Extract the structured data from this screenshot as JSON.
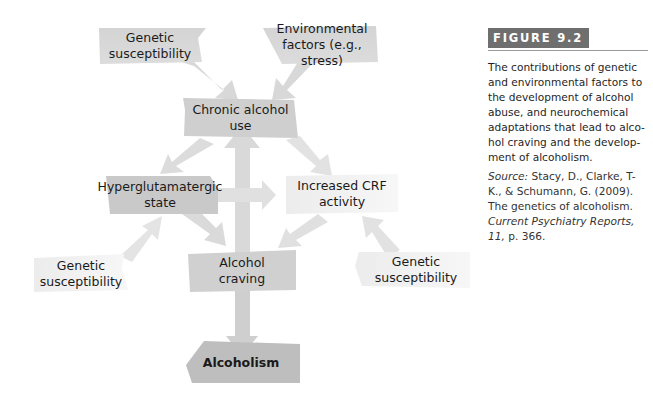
{
  "diagram": {
    "nodes": {
      "genetic_top": "Genetic\nsusceptibility",
      "environmental": "Environmental\nfactors (e.g., stress)",
      "chronic": "Chronic alcohol use",
      "hyperglutamatergic": "Hyperglutamatergic\nstate",
      "crf": "Increased CRF\nactivity",
      "genetic_left": "Genetic\nsusceptibility",
      "craving": "Alcohol\ncraving",
      "genetic_right": "Genetic\nsusceptibility",
      "alcoholism": "Alcoholism"
    },
    "node_lines": {
      "genetic_top": [
        "Genetic",
        "susceptibility"
      ],
      "environmental": [
        "Environmental",
        "factors (e.g., stress)"
      ],
      "chronic": [
        "Chronic alcohol use"
      ],
      "hyperglutamatergic": [
        "Hyperglutamatergic",
        "state"
      ],
      "crf": [
        "Increased CRF",
        "activity"
      ],
      "genetic_left": [
        "Genetic",
        "susceptibility"
      ],
      "craving": [
        "Alcohol",
        "craving"
      ],
      "genetic_right": [
        "Genetic",
        "susceptibility"
      ],
      "alcoholism": [
        "Alcoholism"
      ]
    },
    "edges": [
      {
        "from": "Genetic susceptibility (top)",
        "to": "Chronic alcohol use"
      },
      {
        "from": "Environmental factors (e.g., stress)",
        "to": "Chronic alcohol use"
      },
      {
        "from": "Chronic alcohol use",
        "to": "Hyperglutamatergic state"
      },
      {
        "from": "Chronic alcohol use",
        "to": "Increased CRF activity"
      },
      {
        "from": "Alcohol craving",
        "to": "Chronic alcohol use"
      },
      {
        "from": "Hyperglutamatergic state",
        "to": "Increased CRF activity"
      },
      {
        "from": "Hyperglutamatergic state",
        "to": "Alcohol craving"
      },
      {
        "from": "Increased CRF activity",
        "to": "Alcohol craving"
      },
      {
        "from": "Genetic susceptibility (left)",
        "to": "Hyperglutamatergic state"
      },
      {
        "from": "Genetic susceptibility (right)",
        "to": "Increased CRF activity"
      },
      {
        "from": "Alcohol craving",
        "to": "Alcoholism"
      }
    ],
    "colors": {
      "dark_box": "#c8c8c8",
      "mid_box": "#d9d9d9",
      "light_box": "#eeeeee",
      "arrow": "#d6d6d6",
      "arrow_light": "#e6e6e6",
      "alcoholism_box": "#bdbdbd"
    }
  },
  "caption": {
    "figure_label": "FIGURE 9.2",
    "text": "The contributions of genetic and environmental factors to the development of alcohol abuse, and neurochemical adaptations that lead to alco-hol craving and the develop-ment of alcoholism.",
    "source_label": "Source:",
    "source_authors": " Stacy, D., Clarke, T-K., & Schumann, G. (2009). The genetics of alcoholism. ",
    "source_journal": "Current Psychiatry Reports, 11,",
    "source_page": " p. 366."
  }
}
